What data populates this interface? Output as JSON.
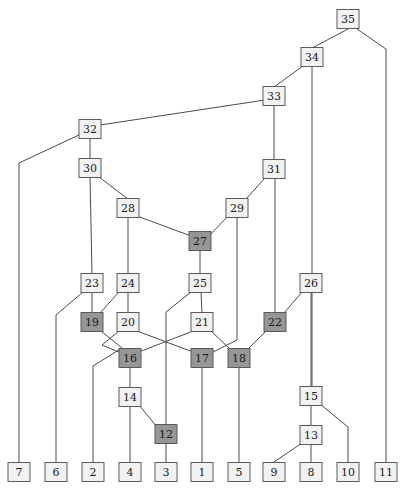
{
  "diagram": {
    "type": "dag-node-link",
    "width": 408,
    "height": 493,
    "style": {
      "node_fill_plain": "#f2f2f2",
      "node_fill_shaded": "#969696",
      "node_stroke": "#5a5a5a",
      "edge_stroke": "#4a4a4a",
      "background": "#ffffff",
      "node_width": 22,
      "node_height": 19,
      "label_font_size": 11
    },
    "legend": {
      "plain_meaning": "unshaded node",
      "shaded_meaning": "shaded node"
    },
    "nodes": [
      {
        "id": "35",
        "label": "35",
        "x": 348,
        "y": 19,
        "shaded": false
      },
      {
        "id": "34",
        "label": "34",
        "x": 312,
        "y": 57,
        "shaded": false
      },
      {
        "id": "33",
        "label": "33",
        "x": 274,
        "y": 96,
        "shaded": false
      },
      {
        "id": "32",
        "label": "32",
        "x": 90,
        "y": 129,
        "shaded": false
      },
      {
        "id": "31",
        "label": "31",
        "x": 274,
        "y": 169,
        "shaded": false
      },
      {
        "id": "30",
        "label": "30",
        "x": 90,
        "y": 168,
        "shaded": false
      },
      {
        "id": "29",
        "label": "29",
        "x": 237,
        "y": 208,
        "shaded": false
      },
      {
        "id": "28",
        "label": "28",
        "x": 128,
        "y": 208,
        "shaded": false
      },
      {
        "id": "27",
        "label": "27",
        "x": 200,
        "y": 241,
        "shaded": true
      },
      {
        "id": "26",
        "label": "26",
        "x": 311,
        "y": 283,
        "shaded": false
      },
      {
        "id": "25",
        "label": "25",
        "x": 200,
        "y": 283,
        "shaded": false
      },
      {
        "id": "24",
        "label": "24",
        "x": 128,
        "y": 283,
        "shaded": false
      },
      {
        "id": "23",
        "label": "23",
        "x": 92,
        "y": 283,
        "shaded": false
      },
      {
        "id": "22",
        "label": "22",
        "x": 275,
        "y": 322,
        "shaded": true
      },
      {
        "id": "21",
        "label": "21",
        "x": 202,
        "y": 322,
        "shaded": false
      },
      {
        "id": "20",
        "label": "20",
        "x": 128,
        "y": 322,
        "shaded": false
      },
      {
        "id": "19",
        "label": "19",
        "x": 92,
        "y": 322,
        "shaded": true
      },
      {
        "id": "18",
        "label": "18",
        "x": 239,
        "y": 358,
        "shaded": true
      },
      {
        "id": "17",
        "label": "17",
        "x": 202,
        "y": 358,
        "shaded": true
      },
      {
        "id": "16",
        "label": "16",
        "x": 130,
        "y": 358,
        "shaded": true
      },
      {
        "id": "15",
        "label": "15",
        "x": 311,
        "y": 396,
        "shaded": false
      },
      {
        "id": "14",
        "label": "14",
        "x": 130,
        "y": 397,
        "shaded": false
      },
      {
        "id": "13",
        "label": "13",
        "x": 311,
        "y": 435,
        "shaded": false
      },
      {
        "id": "12",
        "label": "12",
        "x": 166,
        "y": 434,
        "shaded": true
      },
      {
        "id": "11",
        "label": "11",
        "x": 386,
        "y": 472,
        "shaded": false
      },
      {
        "id": "10",
        "label": "10",
        "x": 348,
        "y": 472,
        "shaded": false
      },
      {
        "id": "9",
        "label": "9",
        "x": 274,
        "y": 472,
        "shaded": false
      },
      {
        "id": "8",
        "label": "8",
        "x": 311,
        "y": 472,
        "shaded": false
      },
      {
        "id": "7",
        "label": "7",
        "x": 19,
        "y": 472,
        "shaded": false
      },
      {
        "id": "6",
        "label": "6",
        "x": 56,
        "y": 472,
        "shaded": false
      },
      {
        "id": "5",
        "label": "5",
        "x": 239,
        "y": 472,
        "shaded": false
      },
      {
        "id": "4",
        "label": "4",
        "x": 130,
        "y": 472,
        "shaded": false
      },
      {
        "id": "3",
        "label": "3",
        "x": 166,
        "y": 472,
        "shaded": false
      },
      {
        "id": "2",
        "label": "2",
        "x": 93,
        "y": 472,
        "shaded": false
      },
      {
        "id": "1",
        "label": "1",
        "x": 202,
        "y": 472,
        "shaded": false
      }
    ],
    "edges": [
      {
        "from": "35",
        "to": "34",
        "points": [
          [
            348,
            29
          ],
          [
            312,
            48
          ]
        ]
      },
      {
        "from": "35",
        "to": "11",
        "points": [
          [
            357,
            29
          ],
          [
            386,
            49
          ],
          [
            386,
            462
          ]
        ]
      },
      {
        "from": "34",
        "to": "33",
        "points": [
          [
            303,
            66
          ],
          [
            274,
            87
          ]
        ]
      },
      {
        "from": "34",
        "to": "8",
        "points": [
          [
            312,
            66
          ],
          [
            312,
            386
          ]
        ]
      },
      {
        "from": "33",
        "to": "32",
        "points": [
          [
            265,
            100
          ],
          [
            100,
            125
          ]
        ]
      },
      {
        "from": "33",
        "to": "31",
        "points": [
          [
            274,
            105
          ],
          [
            274,
            160
          ]
        ]
      },
      {
        "from": "32",
        "to": "7",
        "points": [
          [
            81,
            134
          ],
          [
            19,
            163
          ],
          [
            19,
            462
          ]
        ]
      },
      {
        "from": "32",
        "to": "30",
        "points": [
          [
            90,
            138
          ],
          [
            90,
            159
          ]
        ]
      },
      {
        "from": "30",
        "to": "23",
        "points": [
          [
            90,
            177
          ],
          [
            92,
            274
          ]
        ]
      },
      {
        "from": "30",
        "to": "28",
        "points": [
          [
            99,
            177
          ],
          [
            128,
            199
          ]
        ]
      },
      {
        "from": "31",
        "to": "29",
        "points": [
          [
            265,
            178
          ],
          [
            246,
            199
          ]
        ]
      },
      {
        "from": "31",
        "to": "22",
        "points": [
          [
            275,
            178
          ],
          [
            275,
            313
          ]
        ]
      },
      {
        "from": "28",
        "to": "24",
        "points": [
          [
            128,
            217
          ],
          [
            128,
            274
          ]
        ]
      },
      {
        "from": "28",
        "to": "27",
        "points": [
          [
            137,
            216
          ],
          [
            191,
            236
          ]
        ]
      },
      {
        "from": "29",
        "to": "27",
        "points": [
          [
            228,
            216
          ],
          [
            209,
            236
          ]
        ]
      },
      {
        "from": "29",
        "to": "17",
        "points": [
          [
            237,
            217
          ],
          [
            237,
            340
          ],
          [
            211,
            353
          ]
        ]
      },
      {
        "from": "27",
        "to": "25",
        "points": [
          [
            200,
            250
          ],
          [
            200,
            274
          ]
        ]
      },
      {
        "from": "25",
        "to": "21",
        "points": [
          [
            201,
            292
          ],
          [
            202,
            313
          ]
        ]
      },
      {
        "from": "25",
        "to": "12",
        "points": [
          [
            191,
            292
          ],
          [
            166,
            312
          ],
          [
            166,
            425
          ]
        ]
      },
      {
        "from": "24",
        "to": "20",
        "points": [
          [
            128,
            292
          ],
          [
            128,
            313
          ]
        ]
      },
      {
        "from": "24",
        "to": "19",
        "points": [
          [
            119,
            292
          ],
          [
            100,
            313
          ]
        ]
      },
      {
        "from": "23",
        "to": "19",
        "points": [
          [
            92,
            292
          ],
          [
            92,
            313
          ]
        ]
      },
      {
        "from": "23",
        "to": "6",
        "points": [
          [
            83,
            292
          ],
          [
            56,
            315
          ],
          [
            56,
            462
          ]
        ]
      },
      {
        "from": "26",
        "to": "22",
        "points": [
          [
            302,
            292
          ],
          [
            284,
            313
          ]
        ]
      },
      {
        "from": "26",
        "to": "15",
        "points": [
          [
            311,
            292
          ],
          [
            311,
            387
          ]
        ]
      },
      {
        "from": "19",
        "to": "2",
        "points": [
          [
            101,
            331
          ],
          [
            122,
            348
          ],
          [
            93,
            366
          ],
          [
            93,
            462
          ]
        ]
      },
      {
        "from": "20",
        "to": "16",
        "points": [
          [
            119,
            331
          ],
          [
            102,
            345
          ],
          [
            121,
            353
          ]
        ]
      },
      {
        "from": "20",
        "to": "17",
        "points": [
          [
            137,
            331
          ],
          [
            193,
            352
          ]
        ]
      },
      {
        "from": "21",
        "to": "16",
        "points": [
          [
            193,
            331
          ],
          [
            139,
            352
          ]
        ]
      },
      {
        "from": "21",
        "to": "18",
        "points": [
          [
            211,
            331
          ],
          [
            230,
            349
          ]
        ]
      },
      {
        "from": "22",
        "to": "18",
        "points": [
          [
            266,
            331
          ],
          [
            248,
            349
          ]
        ]
      },
      {
        "from": "16",
        "to": "14",
        "points": [
          [
            130,
            367
          ],
          [
            130,
            388
          ]
        ]
      },
      {
        "from": "17",
        "to": "1",
        "points": [
          [
            202,
            367
          ],
          [
            202,
            462
          ]
        ]
      },
      {
        "from": "18",
        "to": "5",
        "points": [
          [
            239,
            367
          ],
          [
            239,
            462
          ]
        ]
      },
      {
        "from": "14",
        "to": "4",
        "points": [
          [
            130,
            406
          ],
          [
            130,
            462
          ]
        ]
      },
      {
        "from": "14",
        "to": "12",
        "points": [
          [
            139,
            405
          ],
          [
            157,
            427
          ]
        ]
      },
      {
        "from": "12",
        "to": "3",
        "points": [
          [
            166,
            443
          ],
          [
            166,
            462
          ]
        ]
      },
      {
        "from": "15",
        "to": "13",
        "points": [
          [
            311,
            405
          ],
          [
            311,
            426
          ]
        ]
      },
      {
        "from": "15",
        "to": "10",
        "points": [
          [
            320,
            404
          ],
          [
            348,
            427
          ],
          [
            348,
            462
          ]
        ]
      },
      {
        "from": "13",
        "to": "8",
        "points": [
          [
            311,
            444
          ],
          [
            311,
            462
          ]
        ]
      },
      {
        "from": "13",
        "to": "9",
        "points": [
          [
            302,
            443
          ],
          [
            274,
            462
          ]
        ]
      }
    ]
  }
}
